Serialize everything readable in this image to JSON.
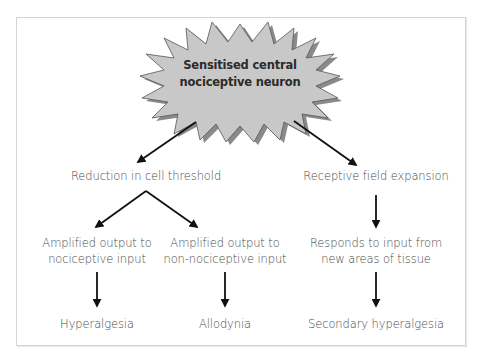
{
  "diagram": {
    "colors": {
      "burst_fill": "#c8c8c8",
      "burst_shadow": "#8a8a8a",
      "burst_stroke": "#555555",
      "arrow": "#111111",
      "text": "#4a4a4a",
      "frame_border": "#d4d4d4"
    },
    "root": {
      "line1": "Sensitised central",
      "line2": "nociceptive neuron",
      "shape": "starburst"
    },
    "left_branch": {
      "label": "Reduction in cell threshold",
      "children": [
        {
          "line1": "Amplified output to",
          "line2": "nociceptive input",
          "outcome": "Hyperalgesia"
        },
        {
          "line1": "Amplified output to",
          "line2": "non-nociceptive input",
          "outcome": "Allodynia"
        }
      ]
    },
    "right_branch": {
      "label": "Receptive field expansion",
      "child": {
        "line1": "Responds to input from",
        "line2": "new areas of tissue",
        "outcome": "Secondary hyperalgesia"
      }
    },
    "icons": {
      "arrow": "arrow-icon",
      "starburst": "starburst-icon"
    }
  }
}
